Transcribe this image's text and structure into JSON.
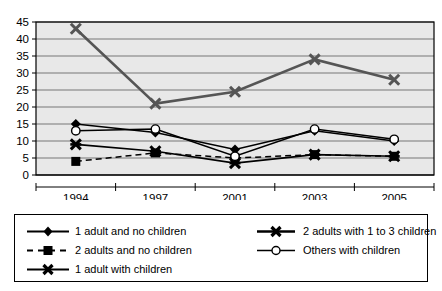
{
  "chart_data": {
    "type": "line",
    "title": "",
    "xlabel": "",
    "ylabel": "",
    "categories": [
      "1994",
      "1997",
      "2001",
      "2003",
      "2005"
    ],
    "ylim": [
      0,
      45
    ],
    "ytick_step": 5,
    "yticks": [
      "0",
      "5",
      "10",
      "15",
      "20",
      "25",
      "30",
      "35",
      "40",
      "45"
    ],
    "grid": true,
    "legend_position": "bottom",
    "series": [
      {
        "name": "1 adult and no children",
        "marker": "diamond",
        "line": "solid",
        "color": "#000000",
        "values": [
          15,
          12.5,
          7.5,
          13,
          10
        ]
      },
      {
        "name": "2 adults and no children",
        "marker": "square",
        "line": "dashed",
        "color": "#000000",
        "values": [
          4,
          6.5,
          5,
          6,
          5.5
        ]
      },
      {
        "name": "1 adult with children",
        "marker": "cross",
        "line": "solid",
        "color": "#555555",
        "values": [
          43,
          21,
          24.5,
          34,
          28
        ]
      },
      {
        "name": "2 adults with 1 to 3 children",
        "marker": "cross-bar",
        "line": "solid",
        "color": "#000000",
        "values": [
          9,
          7,
          3.5,
          6,
          5.5
        ]
      },
      {
        "name": "Others with children",
        "marker": "circle-open",
        "line": "solid",
        "color": "#000000",
        "values": [
          13,
          13.5,
          5.5,
          13.5,
          10.5
        ]
      }
    ]
  },
  "legend": {
    "left_items": [
      {
        "label": "1 adult and no children",
        "key": "diamond-solid-key"
      },
      {
        "label": "2 adults and no children",
        "key": "square-dashed-key"
      },
      {
        "label": "1 adult with children",
        "key": "cross-solid-key"
      }
    ],
    "right_items": [
      {
        "label": "2 adults with 1 to 3 children",
        "key": "crossbar-solid-key"
      },
      {
        "label": "Others with children",
        "key": "circle-open-key"
      }
    ]
  }
}
